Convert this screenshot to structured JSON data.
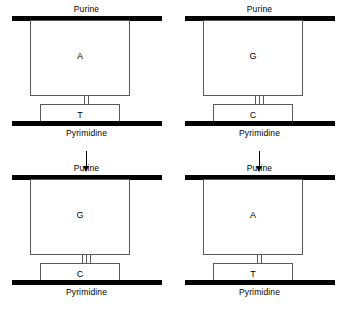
{
  "diagram": {
    "strand_labels": {
      "purine": "Purine",
      "pyrimidine": "Pyrimidine"
    },
    "units": [
      {
        "id": "top-left",
        "top_strand_label": "Purine",
        "bottom_strand_label": "Pyrimidine",
        "purine_base": "A",
        "pyrimidine_base": "T",
        "hydrogen_bonds": 2
      },
      {
        "id": "top-right",
        "top_strand_label": "Purine",
        "bottom_strand_label": "Pyrimidine",
        "purine_base": "G",
        "pyrimidine_base": "C",
        "hydrogen_bonds": 3
      },
      {
        "id": "bottom-left",
        "top_strand_label": "Purine",
        "bottom_strand_label": "Pyrimidine",
        "purine_base": "G",
        "pyrimidine_base": "C",
        "hydrogen_bonds": 3
      },
      {
        "id": "bottom-right",
        "top_strand_label": "Purine",
        "bottom_strand_label": "Pyrimidine",
        "purine_base": "A",
        "pyrimidine_base": "T",
        "hydrogen_bonds": 2
      }
    ],
    "colors": {
      "backbone": "#000000",
      "box_stroke": "#5a5a5a",
      "background": "#ffffff",
      "text": "#000000"
    }
  }
}
